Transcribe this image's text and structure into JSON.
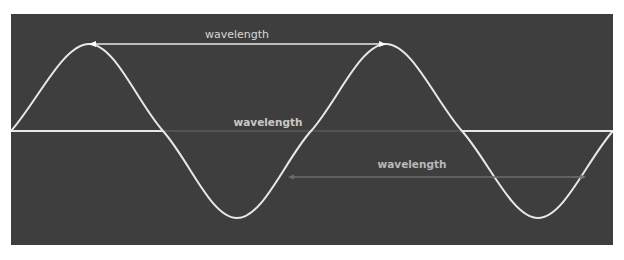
{
  "diagram": {
    "background_color": "#3e3e3e",
    "wave_color": "#e8e8e8",
    "labels": {
      "top": "wavelength",
      "middle": "wavelength",
      "bottom": "wavelength"
    },
    "annotations": [
      {
        "name": "peak-to-peak",
        "label": "wavelength",
        "from_x": 89,
        "to_x": 386,
        "y": 44
      },
      {
        "name": "zero-crossing",
        "label": "wavelength",
        "from_x": 163,
        "to_x": 462,
        "y": 131
      },
      {
        "name": "mid-slope",
        "label": "wavelength",
        "from_x": 290,
        "to_x": 585,
        "y": 177
      }
    ]
  }
}
